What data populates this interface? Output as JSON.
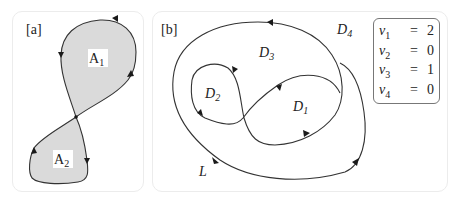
{
  "panels": {
    "a": {
      "label": "[a]",
      "areas": [
        {
          "name": "A",
          "sub": "1"
        },
        {
          "name": "A",
          "sub": "2"
        }
      ],
      "fill_color": "#dadada"
    },
    "b": {
      "label": "[b]",
      "regions": [
        {
          "name": "D",
          "sub": "1"
        },
        {
          "name": "D",
          "sub": "2"
        },
        {
          "name": "D",
          "sub": "3"
        },
        {
          "name": "D",
          "sub": "4"
        }
      ],
      "curve_label": "L",
      "winding_numbers": [
        {
          "symbol": "ν",
          "sub": "1",
          "eq": "=",
          "value": "2"
        },
        {
          "symbol": "ν",
          "sub": "2",
          "eq": "=",
          "value": "0"
        },
        {
          "symbol": "ν",
          "sub": "3",
          "eq": "=",
          "value": "1"
        },
        {
          "symbol": "ν",
          "sub": "4",
          "eq": "=",
          "value": "0"
        }
      ]
    }
  }
}
